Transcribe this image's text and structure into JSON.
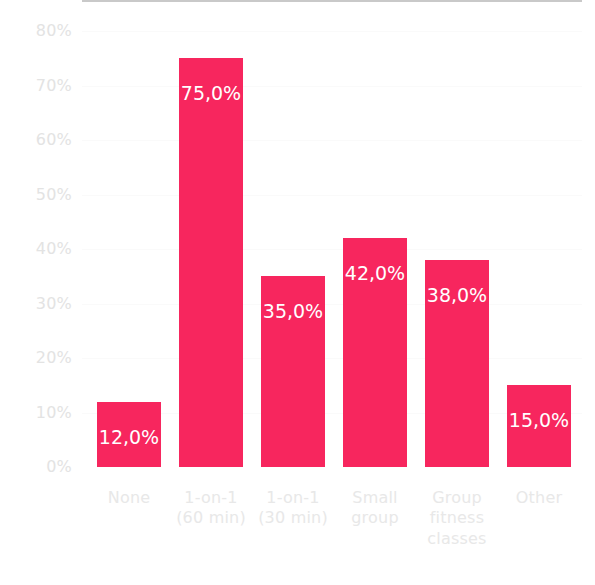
{
  "chart_data": {
    "type": "bar",
    "title": "",
    "subtitle": "",
    "xlabel": "",
    "ylabel": "",
    "categories": [
      "None",
      "1-on-1\n(60 min)",
      "1-on-1\n(30 min)",
      "Small\ngroup",
      "Group\nfitness\nclasses",
      "Other"
    ],
    "values": [
      12.0,
      75.0,
      35.0,
      42.0,
      38.0,
      15.0
    ],
    "data_labels": [
      "12,0%",
      "75,0%",
      "35,0%",
      "42,0%",
      "38,0%",
      "15,0%"
    ],
    "ylim": [
      0,
      80
    ],
    "y_ticks": [
      0,
      10,
      20,
      30,
      40,
      50,
      60,
      70,
      80
    ],
    "y_tick_labels": [
      "0%",
      "10%",
      "20%",
      "30%",
      "40%",
      "50%",
      "60%",
      "70%",
      "80%"
    ],
    "grid": true,
    "legend": null,
    "legend_position": "none",
    "decimal_separator": ",",
    "colors": {
      "bar": "#f7265e",
      "data_label": "#ffffff",
      "tick_label": "#e3e3e3",
      "category_label": "#e8e8e8",
      "axis_line": "#c9c9c9",
      "gridline": "#fafafa",
      "background": "#ffffff"
    }
  }
}
